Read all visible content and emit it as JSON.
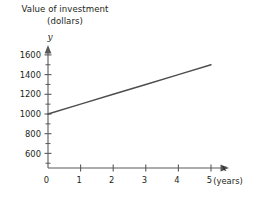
{
  "caption": {
    "line1": "Value of investment",
    "line2": "(dollars)"
  },
  "axis_names": {
    "y": "y",
    "x": "x",
    "x_units": "(years)"
  },
  "chart_data": {
    "type": "line",
    "title": "Value of investment (dollars)",
    "xlabel": "x (years)",
    "ylabel": "y",
    "grid": false,
    "legend": null,
    "xlim": [
      0,
      5.55
    ],
    "ylim": [
      450,
      1680
    ],
    "x_ticks": [
      0,
      1,
      2,
      3,
      4,
      5
    ],
    "x_tick_labels": [
      "0",
      "1",
      "2",
      "3",
      "4",
      "5"
    ],
    "y_ticks": [
      600,
      800,
      1000,
      1200,
      1400,
      1600
    ],
    "y_tick_labels": [
      "600",
      "800",
      "1000",
      "1200",
      "1400",
      "1600"
    ],
    "y_minor_ticks": [
      500,
      700,
      900,
      1100,
      1300,
      1500
    ],
    "series": [
      {
        "name": "Value of investment",
        "x": [
          0,
          1,
          2,
          3,
          4,
          5
        ],
        "values": [
          1000,
          1100,
          1200,
          1300,
          1400,
          1500
        ],
        "color": "#4d4d4f"
      }
    ]
  }
}
